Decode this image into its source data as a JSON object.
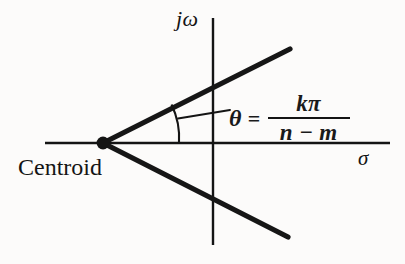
{
  "figure": {
    "background_color": "#fcfbfa",
    "ink_color": "#141414"
  },
  "axes": {
    "vertical": {
      "label": "jω",
      "name": "imaginary-axis",
      "x": 213,
      "y_top": 18,
      "y_bottom": 245,
      "stroke_width": 2
    },
    "horizontal": {
      "label": "σ",
      "name": "real-axis",
      "y": 143,
      "x_left": 45,
      "x_right": 390,
      "stroke_width": 2
    }
  },
  "centroid": {
    "label": "Centroid",
    "x": 103,
    "y": 143,
    "dot_radius": 6
  },
  "asymptotes": [
    {
      "name": "upper-asymptote",
      "x1": 103,
      "y1": 143,
      "x2": 290,
      "y2": 49,
      "stroke_width": 5
    },
    {
      "name": "lower-asymptote",
      "x1": 103,
      "y1": 143,
      "x2": 288,
      "y2": 237,
      "stroke_width": 5
    }
  ],
  "angle_marker": {
    "arc_start_x": 172,
    "arc_start_y": 105,
    "arc_end_x": 178,
    "arc_end_y": 143,
    "radius": 76,
    "leader_x1": 178,
    "leader_y1": 118,
    "leader_x2": 229,
    "leader_y2": 110
  },
  "equation": {
    "theta": "θ",
    "equals": "=",
    "numerator": "kπ",
    "denominator": "n − m"
  }
}
